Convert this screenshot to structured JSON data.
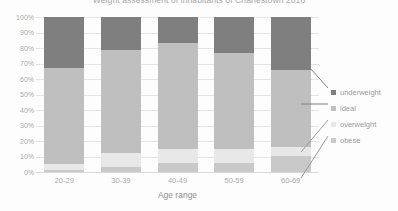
{
  "chart_data": {
    "type": "bar",
    "subtype": "100% stacked column",
    "title": "Weight assessment of inhabitants of Charlestown 2018",
    "xlabel": "Age range",
    "ylabel": "",
    "categories": [
      "20-29",
      "30-39",
      "40-49",
      "50-59",
      "60-69"
    ],
    "ylim": [
      0,
      100
    ],
    "ytick_labels": [
      "100%",
      "90%",
      "80%",
      "70%",
      "60%",
      "50%",
      "40%",
      "30%",
      "20%",
      "10%",
      "0%"
    ],
    "ytick_values": [
      100,
      90,
      80,
      70,
      60,
      50,
      40,
      30,
      20,
      10,
      0
    ],
    "grid": true,
    "legend_position": "right",
    "stack_order_bottom_to_top": [
      "obese",
      "overweight",
      "ideal",
      "underweight"
    ],
    "series": [
      {
        "name": "underweight",
        "color": "#7f7f7f",
        "values": [
          33,
          21,
          17,
          23,
          34
        ]
      },
      {
        "name": "ideal",
        "color": "#bfbfbf",
        "values": [
          62,
          67,
          68,
          62,
          50
        ]
      },
      {
        "name": "overweight",
        "color": "#e8e8e8",
        "values": [
          4,
          9,
          9,
          9,
          6
        ]
      },
      {
        "name": "obese",
        "color": "#c9c9c9",
        "values": [
          1,
          3,
          6,
          6,
          10
        ]
      }
    ]
  },
  "legend": {
    "items": [
      {
        "label": "underweight",
        "color": "#7f7f7f"
      },
      {
        "label": "ideal",
        "color": "#bfbfbf"
      },
      {
        "label": "overweight",
        "color": "#e8e8e8"
      },
      {
        "label": "obese",
        "color": "#c9c9c9"
      }
    ]
  },
  "colors": {
    "background": "#fdfdfd",
    "gridline": "#e4e4e4",
    "axis_text": "#a9a9a9",
    "title_text": "#a6a6a6",
    "leader_line": "#7f7f7f"
  }
}
